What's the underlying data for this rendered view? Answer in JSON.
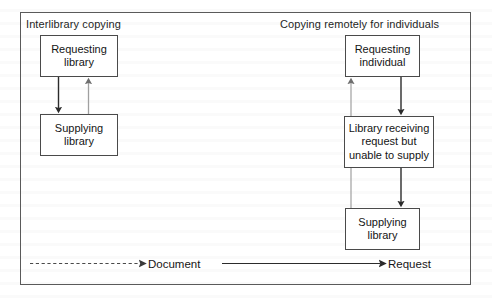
{
  "figure": {
    "sections": [
      {
        "id": "interlibrary",
        "title": "Interlibrary copying"
      },
      {
        "id": "remote",
        "title": "Copying remotely for individuals"
      }
    ],
    "nodes": [
      {
        "id": "requesting-library",
        "section": "interlibrary",
        "line1": "Requesting",
        "line2": "library",
        "line3": ""
      },
      {
        "id": "supplying-library-left",
        "section": "interlibrary",
        "line1": "Supplying",
        "line2": "library",
        "line3": ""
      },
      {
        "id": "requesting-individual",
        "section": "remote",
        "line1": "Requesting",
        "line2": "individual",
        "line3": ""
      },
      {
        "id": "library-unable-to-supply",
        "section": "remote",
        "line1": "Library receiving",
        "line2": "request but",
        "line3": "unable to supply"
      },
      {
        "id": "supplying-library-right",
        "section": "remote",
        "line1": "Supplying",
        "line2": "library",
        "line3": ""
      }
    ],
    "edges": [
      {
        "id": "req-lib-to-sup-lib",
        "from": "requesting-library",
        "to": "supplying-library-left",
        "kind": "request"
      },
      {
        "id": "sup-lib-to-req-lib",
        "from": "supplying-library-left",
        "to": "requesting-library",
        "kind": "document"
      },
      {
        "id": "req-ind-to-library-unable",
        "from": "requesting-individual",
        "to": "library-unable-to-supply",
        "kind": "request"
      },
      {
        "id": "library-unable-to-sup-lib",
        "from": "library-unable-to-supply",
        "to": "supplying-library-right",
        "kind": "request"
      },
      {
        "id": "sup-lib-to-req-ind",
        "from": "supplying-library-right",
        "to": "requesting-individual",
        "kind": "document"
      }
    ],
    "legend": [
      {
        "id": "document",
        "label": "Document",
        "kind": "document",
        "style": "dashed"
      },
      {
        "id": "request",
        "label": "Request",
        "kind": "request",
        "style": "solid"
      }
    ],
    "colors": {
      "frame_stroke": "#5a5a5a",
      "box_stroke": "#4a4a4a",
      "text": "#141414",
      "request_arrow": "#2b2b2b",
      "document_arrow": "#9a9a9a",
      "page_background": "#ffffff"
    }
  }
}
